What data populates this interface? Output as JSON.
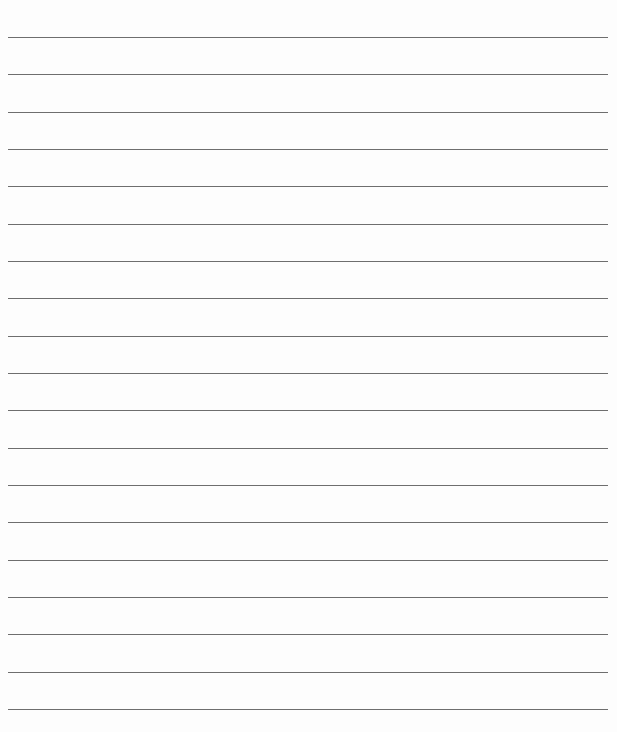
{
  "page": {
    "type": "lined-paper",
    "background_color": "#fdfdfd",
    "line_color": "#6e6e6e",
    "line_count": 19,
    "first_line_y": 37,
    "line_spacing": 37.33,
    "line_left": 8,
    "line_width": 600
  }
}
